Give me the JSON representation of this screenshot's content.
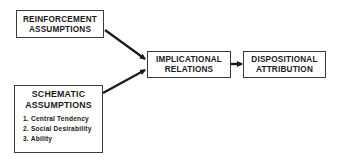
{
  "diagram": {
    "nodes": {
      "reinforcement": {
        "line1": "REINFORCEMENT",
        "line2": "ASSUMPTIONS"
      },
      "schematic": {
        "line1": "SCHEMATIC",
        "line2": "ASSUMPTIONS",
        "items": [
          "1. Central Tendency",
          "2.  Social Desirability",
          "3.  Ability"
        ]
      },
      "implicational": {
        "line1": "IMPLICATIONAL",
        "line2": "RELATIONS"
      },
      "dispositional": {
        "line1": "DISPOSITIONAL",
        "line2": "ATTRIBUTION"
      }
    },
    "edges": [
      {
        "from": "reinforcement",
        "to": "implicational"
      },
      {
        "from": "schematic",
        "to": "implicational"
      },
      {
        "from": "implicational",
        "to": "dispositional"
      }
    ],
    "colors": {
      "line": "#1a1a1a",
      "border": "#3a3a3a",
      "background": "#ffffff"
    }
  }
}
